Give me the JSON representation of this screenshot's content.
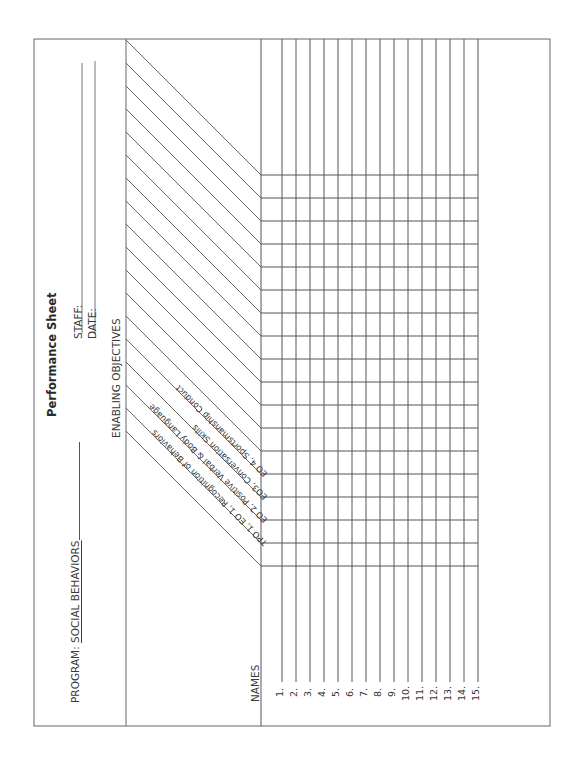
{
  "sheet": {
    "title": "Performance Sheet",
    "program_label": "PROGRAM:",
    "program_value": "SOCIAL BEHAVIORS",
    "staff_label": "STAFF:",
    "staff_value": "",
    "date_label": "DATE:",
    "date_value": "",
    "section_heading": "ENABLING OBJECTIVES",
    "names_heading": "NAMES",
    "objectives": [
      "TPO 1, EO 1, Recognition of Behaviors",
      "EO 2, Positive Verbal & Body Language",
      "EO3, Conversation Skills",
      "EO 4, Sportsmanship Conduct"
    ],
    "blank_objective_columns": 13,
    "name_rows": [
      "1.",
      "2.",
      "3.",
      "4.",
      "5.",
      "6.",
      "7.",
      "8.",
      "9.",
      "10.",
      "11.",
      "12.",
      "13.",
      "14.",
      "15."
    ],
    "name_values": [
      "",
      "",
      "",
      "",
      "",
      "",
      "",
      "",
      "",
      "",
      "",
      "",
      "",
      "",
      ""
    ],
    "orientation": "rotated 90° counter-clockwise (landscape form)",
    "line_color": "#555555"
  }
}
